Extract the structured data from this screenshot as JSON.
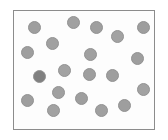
{
  "figure": {
    "type": "scatter-dot-distribution",
    "canvas": {
      "width": 168,
      "height": 140,
      "background": "#ffffff"
    },
    "frame": {
      "name": "plot-frame",
      "x": 13,
      "y": 10,
      "width": 142,
      "height": 120,
      "fill": "#fdfdfd",
      "border_color": "#8c8c8c",
      "border_width": 1
    },
    "dot_style": {
      "default_fill": "#9e9e9e",
      "highlight_fill": "#808080",
      "stroke": "#939393",
      "diameter": 13
    },
    "dot_count": 20,
    "dots": [
      {
        "id": 1,
        "cx": 34,
        "cy": 27,
        "r": 6.5,
        "fill": "#9e9e9e"
      },
      {
        "id": 2,
        "cx": 73,
        "cy": 22,
        "r": 6.5,
        "fill": "#a0a0a0"
      },
      {
        "id": 3,
        "cx": 96,
        "cy": 27,
        "r": 6.5,
        "fill": "#9e9e9e"
      },
      {
        "id": 4,
        "cx": 117,
        "cy": 36,
        "r": 6.5,
        "fill": "#a2a2a2"
      },
      {
        "id": 5,
        "cx": 143,
        "cy": 27,
        "r": 6.5,
        "fill": "#9e9e9e"
      },
      {
        "id": 6,
        "cx": 52,
        "cy": 43,
        "r": 6.5,
        "fill": "#a0a0a0"
      },
      {
        "id": 7,
        "cx": 27,
        "cy": 52,
        "r": 6.5,
        "fill": "#9e9e9e"
      },
      {
        "id": 8,
        "cx": 90,
        "cy": 54,
        "r": 6.5,
        "fill": "#a0a0a0"
      },
      {
        "id": 9,
        "cx": 137,
        "cy": 58,
        "r": 6.5,
        "fill": "#9e9e9e"
      },
      {
        "id": 10,
        "cx": 39,
        "cy": 76,
        "r": 6.5,
        "fill": "#808080"
      },
      {
        "id": 11,
        "cx": 64,
        "cy": 70,
        "r": 6.5,
        "fill": "#a2a2a2"
      },
      {
        "id": 12,
        "cx": 89,
        "cy": 74,
        "r": 6.5,
        "fill": "#9e9e9e"
      },
      {
        "id": 13,
        "cx": 112,
        "cy": 75,
        "r": 6.5,
        "fill": "#9e9e9e"
      },
      {
        "id": 14,
        "cx": 143,
        "cy": 89,
        "r": 6.5,
        "fill": "#a2a2a2"
      },
      {
        "id": 15,
        "cx": 58,
        "cy": 92,
        "r": 6.5,
        "fill": "#a0a0a0"
      },
      {
        "id": 16,
        "cx": 27,
        "cy": 100,
        "r": 6.5,
        "fill": "#9e9e9e"
      },
      {
        "id": 17,
        "cx": 81,
        "cy": 98,
        "r": 6.5,
        "fill": "#9e9e9e"
      },
      {
        "id": 18,
        "cx": 124,
        "cy": 105,
        "r": 6.5,
        "fill": "#9e9e9e"
      },
      {
        "id": 19,
        "cx": 53,
        "cy": 110,
        "r": 6.5,
        "fill": "#a2a2a2"
      },
      {
        "id": 20,
        "cx": 101,
        "cy": 110,
        "r": 6.5,
        "fill": "#a0a0a0"
      }
    ]
  }
}
